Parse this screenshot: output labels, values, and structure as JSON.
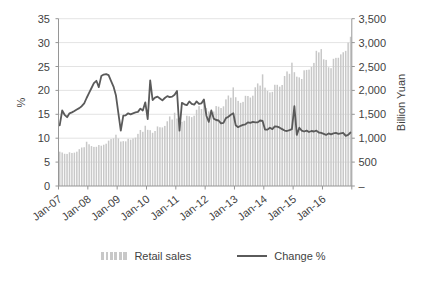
{
  "chart": {
    "left_axis": {
      "label": "%",
      "ticks": [
        "35",
        "30",
        "25",
        "20",
        "15",
        "10",
        "5",
        "0"
      ],
      "min": 0,
      "max": 35
    },
    "right_axis": {
      "label": "Billion Yuan",
      "ticks": [
        "3,500",
        "3,000",
        "2,500",
        "2,000",
        "1,500",
        "1,000",
        "500",
        "–"
      ],
      "min": 0,
      "max": 3500
    },
    "x_axis": {
      "tick_labels": [
        "Jan-07",
        "Jan-08",
        "Jan-09",
        "Jan-10",
        "Jan-11",
        "Jan-12",
        "Jan-13",
        "Jan-14",
        "Jan-15",
        "Jan-16"
      ]
    },
    "legend": [
      {
        "label": "Retail sales",
        "type": "bar",
        "color": "#c8c8c8"
      },
      {
        "label": "Change %",
        "type": "line",
        "color": "#5a5a5a"
      }
    ],
    "colors": {
      "grid": "#dcdcdc",
      "axis": "#969696",
      "text": "#3f3f3f",
      "background": "#ffffff"
    }
  },
  "chart_data": {
    "type": "bar",
    "subtype": "combo-bar-line",
    "frequency": "monthly",
    "x_start": "Jan-2007",
    "x_end": "Dec-2016",
    "n_points": 120,
    "xlabel": "",
    "title": "",
    "legend_position": "bottom",
    "grid": "horizontal",
    "series": [
      {
        "name": "Retail sales",
        "axis": "right",
        "unit": "Billion Yuan",
        "ylim": [
          0,
          3500
        ],
        "values": [
          718,
          701,
          674,
          671,
          705,
          691,
          698,
          718,
          770,
          805,
          811,
          926,
          873,
          835,
          818,
          820,
          857,
          843,
          863,
          885,
          949,
          982,
          996,
          1073,
          995,
          930,
          938,
          934,
          987,
          970,
          994,
          1012,
          1091,
          1172,
          1134,
          1261,
          1175,
          1168,
          1113,
          1151,
          1246,
          1229,
          1225,
          1257,
          1354,
          1455,
          1391,
          1533,
          1412,
          1367,
          1344,
          1365,
          1470,
          1459,
          1441,
          1471,
          1595,
          1671,
          1611,
          1811,
          1633,
          1561,
          1545,
          1558,
          1672,
          1660,
          1632,
          1667,
          1812,
          1893,
          1848,
          2063,
          1857,
          1781,
          1740,
          1760,
          1887,
          1883,
          1851,
          1889,
          2065,
          2146,
          2101,
          2336,
          2058,
          1990,
          1958,
          1970,
          2118,
          2117,
          2078,
          2113,
          2301,
          2397,
          2347,
          2580,
          2381,
          2287,
          2272,
          2239,
          2420,
          2428,
          2434,
          2489,
          2575,
          2828,
          2796,
          2864,
          2650,
          2638,
          2484,
          2465,
          2661,
          2681,
          2683,
          2754,
          2798,
          2827,
          3000,
          3122
        ]
      },
      {
        "name": "Change %",
        "axis": "left",
        "unit": "%",
        "ylim": [
          0,
          35
        ],
        "values": [
          12.7,
          15.8,
          14.9,
          14.4,
          15.2,
          15.4,
          15.7,
          16.0,
          16.3,
          16.7,
          17.3,
          18.4,
          19.5,
          20.5,
          21.5,
          22.0,
          20.7,
          23.0,
          23.3,
          23.4,
          23.2,
          22.0,
          20.8,
          19.0,
          15.2,
          11.6,
          14.7,
          14.8,
          15.2,
          15.0,
          15.2,
          15.4,
          15.5,
          16.2,
          15.8,
          17.5,
          14.0,
          22.1,
          18.0,
          18.5,
          18.7,
          18.3,
          17.9,
          18.4,
          18.8,
          18.6,
          18.7,
          19.1,
          19.9,
          11.6,
          17.4,
          17.1,
          16.9,
          17.7,
          17.2,
          17.0,
          17.7,
          17.2,
          17.3,
          18.1,
          14.7,
          13.4,
          15.8,
          14.1,
          13.8,
          13.7,
          13.1,
          13.2,
          14.2,
          14.5,
          14.9,
          15.2,
          12.7,
          12.3,
          12.6,
          12.8,
          12.9,
          13.3,
          13.2,
          13.4,
          13.3,
          13.3,
          13.7,
          13.6,
          11.8,
          11.8,
          12.2,
          11.9,
          12.5,
          12.4,
          12.2,
          11.9,
          11.6,
          11.5,
          11.7,
          11.9,
          16.7,
          10.7,
          12.2,
          11.6,
          11.4,
          11.6,
          11.3,
          11.5,
          11.4,
          11.6,
          11.2,
          11.1,
          10.9,
          10.7,
          11.0,
          10.8,
          11.0,
          11.1,
          10.9,
          11.0,
          11.1,
          10.5,
          10.7,
          11.2
        ]
      }
    ]
  }
}
